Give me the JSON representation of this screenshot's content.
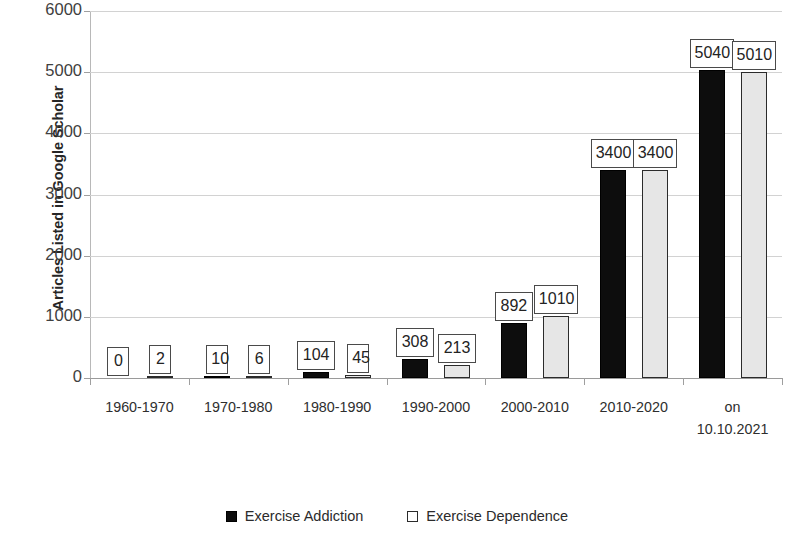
{
  "chart_data": {
    "type": "bar",
    "title": "",
    "subtitle": "",
    "xlabel": "",
    "ylabel": "Articles Listed in Google Scholar",
    "ylim": [
      0,
      6000
    ],
    "ytick_labels": [
      "0",
      "1000",
      "2000",
      "3000",
      "4000",
      "5000",
      "6000"
    ],
    "yticks": [
      0,
      1000,
      2000,
      3000,
      4000,
      5000,
      6000
    ],
    "grid": true,
    "legend_position": "bottom",
    "categories": [
      "1960-1970",
      "1970-1980",
      "1980-1990",
      "1990-2000",
      "2000-2010",
      "2010-2020",
      "on\n10.10.2021"
    ],
    "series": [
      {
        "name": "Exercise Addiction",
        "color": "#0d0d0d",
        "values": [
          0,
          10,
          104,
          308,
          892,
          3400,
          5040
        ],
        "value_labels": [
          "0",
          "10",
          "104",
          "308",
          "892",
          "3400",
          "5040"
        ]
      },
      {
        "name": "Exercise Dependence",
        "color": "#e6e6e6",
        "values": [
          2,
          6,
          45,
          213,
          1010,
          3400,
          5010
        ],
        "value_labels": [
          "2",
          "6",
          "45",
          "213",
          "1010",
          "3400",
          "5010"
        ]
      }
    ]
  }
}
